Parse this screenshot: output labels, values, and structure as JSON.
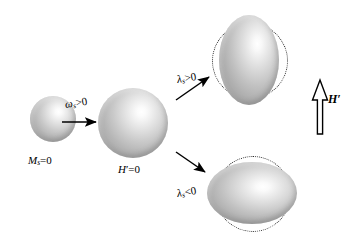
{
  "figure": {
    "type": "diagram",
    "background_color": "#ffffff",
    "stroke_color": "#000000",
    "body_fill_light": "#ffffff",
    "body_fill_dark": "#9a9a9a"
  },
  "labels": {
    "initial_state": {
      "symbol": "M",
      "subscript": "s",
      "relation": "=0",
      "full": "Ms=0"
    },
    "magnetized_state": {
      "symbol": "H",
      "prime": "′",
      "relation": "=0",
      "full": "H′=0"
    },
    "transition_volume": {
      "symbol": "ω",
      "subscript": "s",
      "relation": ">0",
      "full": "ωs>0"
    },
    "branch_positive": {
      "symbol": "λ",
      "subscript": "s",
      "relation": ">0",
      "full": "λs>0"
    },
    "branch_negative": {
      "symbol": "λ",
      "subscript": "s",
      "relation": "<0",
      "full": "λs<0"
    },
    "field_vector": {
      "symbol": "H",
      "prime": "′",
      "full": "H′"
    }
  },
  "shapes": [
    {
      "name": "small-sphere",
      "role": "demagnetized-sphere",
      "cx": 53,
      "cy": 119,
      "rx": 23,
      "ry": 23
    },
    {
      "name": "large-sphere",
      "role": "spontaneously-magnetized-sphere",
      "cx": 133,
      "cy": 123,
      "rx": 35,
      "ry": 35
    },
    {
      "name": "prolate-ellipsoid",
      "role": "positive-magnetostriction-body",
      "cx": 249,
      "cy": 60,
      "rx": 30,
      "ry": 45
    },
    {
      "name": "oblate-ellipsoid",
      "role": "negative-magnetostriction-body",
      "cx": 252,
      "cy": 193,
      "rx": 45,
      "ry": 31
    }
  ],
  "reference_rings": [
    {
      "name": "prolate-reference-circle",
      "cx": 249,
      "cy": 60,
      "r": 37
    },
    {
      "name": "oblate-reference-circle",
      "cx": 252,
      "cy": 193,
      "r": 37
    }
  ],
  "arrows": [
    {
      "name": "growth-arrow",
      "from": [
        62,
        122
      ],
      "to": [
        97,
        122
      ],
      "style": "solid-thin"
    },
    {
      "name": "positive-branch-arrow",
      "from": [
        176,
        98
      ],
      "to": [
        210,
        76
      ],
      "style": "solid-thin"
    },
    {
      "name": "negative-branch-arrow",
      "from": [
        176,
        152
      ],
      "to": [
        206,
        172
      ],
      "style": "solid-thin"
    },
    {
      "name": "field-direction-arrow",
      "from": [
        320,
        133
      ],
      "to": [
        320,
        83
      ],
      "style": "hollow-outline"
    }
  ]
}
